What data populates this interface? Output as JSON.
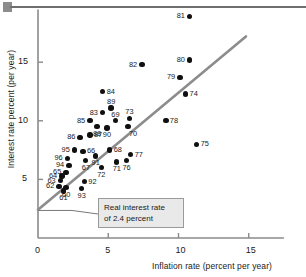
{
  "figure": {
    "top_rule": "horizontal-rule",
    "annotation": {
      "line1": "Real interest rate",
      "line2": "of 2.4 percent"
    }
  },
  "chart_data": {
    "type": "scatter",
    "title": "",
    "xlabel": "Inflation rate (percent per year)",
    "ylabel": "Interest rate percent (per year)",
    "xlim": [
      0,
      17.5
    ],
    "ylim": [
      0,
      19.5
    ],
    "xticks": [
      0,
      5,
      10,
      15
    ],
    "xtick_labels": [
      "0",
      "5",
      "10",
      "15"
    ],
    "yticks": [
      5,
      10,
      15
    ],
    "ytick_labels": [
      "5",
      "10",
      "15"
    ],
    "grid": false,
    "legend": false,
    "reference_line": {
      "label": "Real interest rate of 2.4 percent",
      "intercept": 2.4,
      "slope": 1.0,
      "color": "#8c8c8c",
      "x_start": 0.0,
      "x_end": 14.8
    },
    "point_label_key": "year (two-digit)",
    "points": [
      {
        "label": "81",
        "x": 10.8,
        "y": 18.9,
        "label_side": "left"
      },
      {
        "label": "80",
        "x": 10.8,
        "y": 15.2,
        "label_side": "left"
      },
      {
        "label": "82",
        "x": 7.4,
        "y": 14.8,
        "label_side": "left"
      },
      {
        "label": "79",
        "x": 10.1,
        "y": 13.7,
        "label_side": "left"
      },
      {
        "label": "74",
        "x": 10.5,
        "y": 12.3,
        "label_side": "right"
      },
      {
        "label": "84",
        "x": 4.6,
        "y": 12.5,
        "label_side": "right"
      },
      {
        "label": "89",
        "x": 5.2,
        "y": 11.1,
        "label_side": "above"
      },
      {
        "label": "83",
        "x": 4.6,
        "y": 10.7,
        "label_side": "left"
      },
      {
        "label": "73",
        "x": 6.5,
        "y": 10.2,
        "label_side": "above"
      },
      {
        "label": "69",
        "x": 5.5,
        "y": 10.0,
        "label_side": "above"
      },
      {
        "label": "85",
        "x": 3.7,
        "y": 10.0,
        "label_side": "left"
      },
      {
        "label": "78",
        "x": 9.1,
        "y": 10.0,
        "label_side": "right"
      },
      {
        "label": "70",
        "x": 6.4,
        "y": 9.5,
        "label_side": "below-right"
      },
      {
        "label": "88",
        "x": 4.2,
        "y": 9.5,
        "label_side": "below"
      },
      {
        "label": "90",
        "x": 4.9,
        "y": 9.4,
        "label_side": "below"
      },
      {
        "label": "87",
        "x": 3.7,
        "y": 8.8,
        "label_side": "right"
      },
      {
        "label": "86",
        "x": 3.0,
        "y": 8.6,
        "label_side": "left"
      },
      {
        "label": "75",
        "x": 11.3,
        "y": 8.0,
        "label_side": "right"
      },
      {
        "label": "68",
        "x": 5.1,
        "y": 7.5,
        "label_side": "right"
      },
      {
        "label": "66",
        "x": 3.2,
        "y": 7.4,
        "label_side": "right"
      },
      {
        "label": "95",
        "x": 2.6,
        "y": 7.5,
        "label_side": "left"
      },
      {
        "label": "77",
        "x": 6.6,
        "y": 7.1,
        "label_side": "right"
      },
      {
        "label": "91",
        "x": 4.1,
        "y": 7.0,
        "label_side": "below"
      },
      {
        "label": "96",
        "x": 2.1,
        "y": 6.8,
        "label_side": "left"
      },
      {
        "label": "76",
        "x": 6.3,
        "y": 6.6,
        "label_side": "below"
      },
      {
        "label": "67",
        "x": 3.4,
        "y": 6.6,
        "label_side": "below"
      },
      {
        "label": "94",
        "x": 2.2,
        "y": 6.2,
        "label_side": "left"
      },
      {
        "label": "71",
        "x": 5.6,
        "y": 6.5,
        "label_side": "below"
      },
      {
        "label": "72",
        "x": 4.5,
        "y": 6.0,
        "label_side": "below"
      },
      {
        "label": "65",
        "x": 2.0,
        "y": 5.6,
        "label_side": "left"
      },
      {
        "label": "64",
        "x": 1.7,
        "y": 5.3,
        "label_side": "left"
      },
      {
        "label": "63",
        "x": 1.6,
        "y": 4.9,
        "label_side": "left"
      },
      {
        "label": "92",
        "x": 3.3,
        "y": 4.8,
        "label_side": "right"
      },
      {
        "label": "62",
        "x": 1.5,
        "y": 4.4,
        "label_side": "left"
      },
      {
        "label": "60",
        "x": 2.0,
        "y": 4.3,
        "label_side": "below"
      },
      {
        "label": "93",
        "x": 3.1,
        "y": 4.2,
        "label_side": "below"
      },
      {
        "label": "61",
        "x": 1.8,
        "y": 4.0,
        "label_side": "below"
      }
    ]
  }
}
